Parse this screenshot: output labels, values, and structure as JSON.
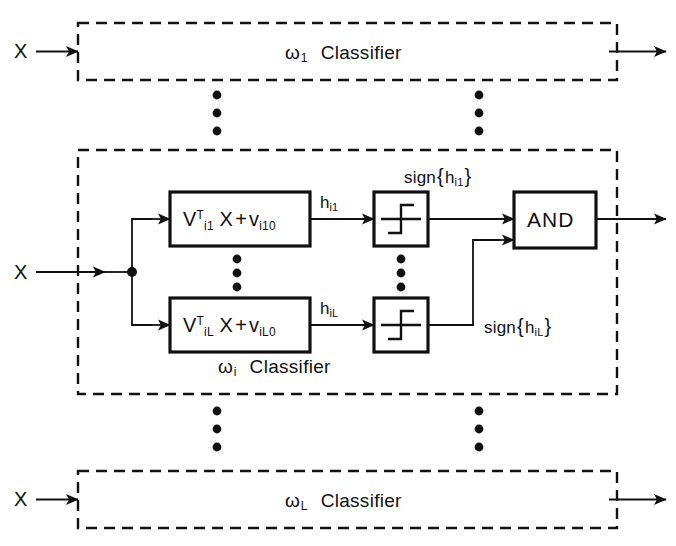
{
  "figure": {
    "type": "block-diagram"
  },
  "inputs": {
    "label": "X"
  },
  "classifiers": {
    "top": {
      "omega": "ω",
      "subscript": "1",
      "name": "Classifier"
    },
    "middle": {
      "omega": "ω",
      "subscript": "i",
      "name": "Classifier"
    },
    "bottom": {
      "omega": "ω",
      "subscript": "L",
      "name": "Classifier"
    }
  },
  "middle_detail": {
    "discriminants": [
      {
        "V": "V",
        "V_sup": "T",
        "V_sub": "i1",
        "X": "X",
        "plus": "+",
        "v": "v",
        "v_sub": "i10",
        "output_label": "h",
        "output_sub": "i1",
        "sign_label_prefix": "sign",
        "sign_brace_open": "{",
        "sign_arg": "h",
        "sign_arg_sub": "i1",
        "sign_brace_close": "}"
      },
      {
        "V": "V",
        "V_sup": "T",
        "V_sub": "iL",
        "X": "X",
        "plus": "+",
        "v": "v",
        "v_sub": "iL0",
        "output_label": "h",
        "output_sub": "iL",
        "sign_label_prefix": "sign",
        "sign_brace_open": "{",
        "sign_arg": "h",
        "sign_arg_sub": "iL",
        "sign_brace_close": "}"
      }
    ],
    "sign_blocks": {
      "icon": "signum-step-icon",
      "count": 2
    },
    "and_gate": {
      "label": "AND"
    }
  },
  "ellipses": {
    "glyph": "•",
    "vertical_groups": 6,
    "dots_per_group": 3
  },
  "colors": {
    "ink": "#111111",
    "background": "#ffffff"
  }
}
